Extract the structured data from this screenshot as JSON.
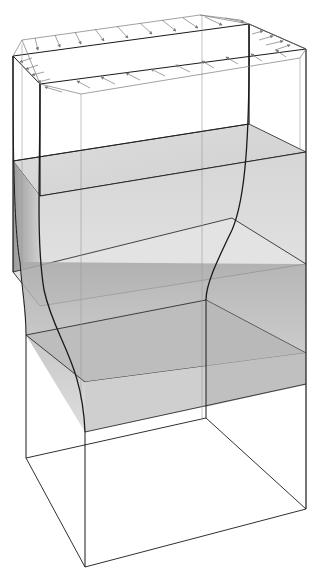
{
  "diagram": {
    "title": "",
    "colors": {
      "edge": "#1a1a1a",
      "thin_edge": "#8a8a8a",
      "arrow": "#7a7a7a",
      "slab_light": "#d9d9d9",
      "slab_dark": "#a8a8a8",
      "background": "#ffffff"
    },
    "elements": [
      {
        "name": "undeformed-box-outline",
        "type": "wireframe"
      },
      {
        "name": "top-traction-arrows",
        "type": "arrow-field",
        "count_back_row": 10,
        "count_front_row": 10,
        "count_left_side": 4,
        "count_right_side": 4
      },
      {
        "name": "upper-shaded-slab",
        "type": "shaded-layer"
      },
      {
        "name": "lower-shaded-slab",
        "type": "shaded-layer"
      },
      {
        "name": "deformed-profile-curve-left",
        "type": "curve"
      },
      {
        "name": "deformed-profile-curve-right",
        "type": "curve"
      }
    ]
  }
}
